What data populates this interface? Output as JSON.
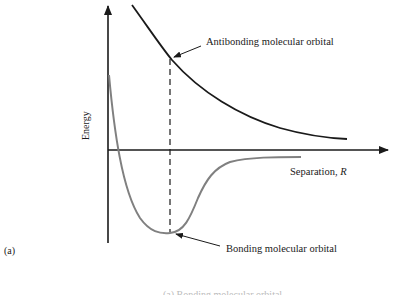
{
  "figure": {
    "panel_label": "(a)",
    "y_axis_label": "Energy",
    "x_axis_label": "Separation, R",
    "curves": [
      {
        "name": "antibonding",
        "label": "Antibonding molecular orbital",
        "color": "#1a1a1a"
      },
      {
        "name": "bonding",
        "label": "Bonding molecular orbital",
        "color": "#808080"
      }
    ],
    "equilibrium_marker": "dashed vertical line at bonding minimum",
    "cropped_caption": "(a) Bonding molecular orbital"
  },
  "colors": {
    "axis": "#1a1a1a",
    "antibonding": "#1a1a1a",
    "bonding": "#808080",
    "background": "#ffffff"
  }
}
